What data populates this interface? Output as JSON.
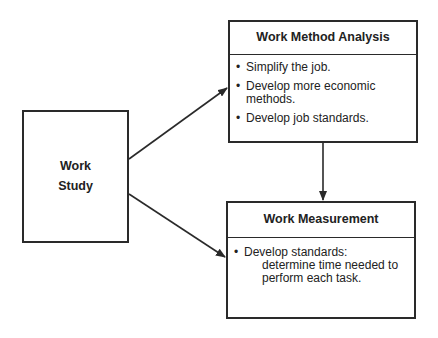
{
  "diagram": {
    "root": {
      "line1": "Work",
      "line2": "Study"
    },
    "method_analysis": {
      "title": "Work Method Analysis",
      "items": [
        {
          "bullet": "•",
          "text": "Simplify the job."
        },
        {
          "bullet": "•",
          "text": "Develop more economic methods."
        },
        {
          "bullet": "•",
          "text": "Develop job standards."
        }
      ]
    },
    "measurement": {
      "title": "Work Measurement",
      "bullet": "•",
      "item_head": "Develop standards:",
      "item_cont": "determine time needed to perform each task."
    },
    "edges": [
      {
        "from": "Work Study",
        "to": "Work Method Analysis"
      },
      {
        "from": "Work Study",
        "to": "Work Measurement"
      },
      {
        "from": "Work Method Analysis",
        "to": "Work Measurement"
      }
    ]
  }
}
